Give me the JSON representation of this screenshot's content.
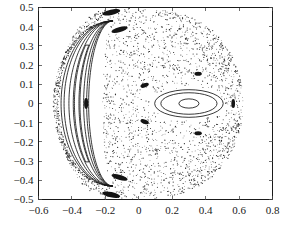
{
  "figure": {
    "kind": "poincare-section-scatter-plot",
    "background_color": "#ffffff",
    "frame_color": "#1a1a1a",
    "point_color": "#2b2b2b",
    "curve_color": "#161616"
  },
  "chart_data": {
    "type": "scatter",
    "title": "",
    "subtitle": "",
    "xlabel": "",
    "ylabel": "",
    "xlim": [
      -0.6,
      0.8
    ],
    "ylim": [
      -0.5,
      0.5
    ],
    "grid": false,
    "legend": "none",
    "xticks": [
      -0.6,
      -0.4,
      -0.2,
      0,
      0.2,
      0.4,
      0.6,
      0.8
    ],
    "xticklabels": [
      "−0.6",
      "−0.4",
      "−0.2",
      "0",
      "0.2",
      "0.4",
      "0.6",
      "0.8"
    ],
    "yticks": [
      0.5,
      0.4,
      0.3,
      0.2,
      0.1,
      0,
      -0.1,
      -0.2,
      -0.3,
      -0.4,
      -0.5
    ],
    "yticklabels": [
      "0.5",
      "0.4",
      "0.3",
      "0.2",
      "0.1",
      "0",
      "−0.1",
      "−0.2",
      "−0.3",
      "−0.4",
      "−0.5"
    ],
    "series": [
      {
        "name": "chaotic sea",
        "kind": "scatter",
        "n_points": 2400,
        "marker": "point",
        "marker_size": 0.55,
        "color": "#2b2b2b",
        "region": "annulus bounded outwardly by x in [-0.47, 0.60], y in [-0.49, 0.49]"
      },
      {
        "name": "central island chain",
        "kind": "closed-curves",
        "center": [
          0.3,
          0.0
        ],
        "curves": [
          {
            "semi_x": 0.205,
            "semi_y": 0.072
          },
          {
            "semi_x": 0.168,
            "semi_y": 0.056
          },
          {
            "semi_x": 0.06,
            "semi_y": 0.024
          }
        ]
      },
      {
        "name": "left crescent KAM structure",
        "kind": "nested-crescents",
        "tip_top": [
          -0.155,
          0.43
        ],
        "tip_bottom": [
          -0.155,
          -0.43
        ],
        "outer_extent_x": -0.47,
        "n_curves": 4
      }
    ],
    "islands": [
      {
        "label": "left-axis island",
        "center": [
          -0.315,
          0.0
        ],
        "semi_x": 0.012,
        "semi_y": 0.028,
        "angle_deg": 0
      },
      {
        "label": "right-axis island",
        "center": [
          0.565,
          0.0
        ],
        "semi_x": 0.011,
        "semi_y": 0.024,
        "angle_deg": 0
      },
      {
        "label": "upper-inner island",
        "center": [
          0.035,
          0.095
        ],
        "semi_x": 0.026,
        "semi_y": 0.011,
        "angle_deg": -20
      },
      {
        "label": "lower-inner island",
        "center": [
          0.035,
          -0.095
        ],
        "semi_x": 0.026,
        "semi_y": 0.011,
        "angle_deg": 20
      },
      {
        "label": "upper-right island",
        "center": [
          0.355,
          0.155
        ],
        "semi_x": 0.022,
        "semi_y": 0.011,
        "angle_deg": 0
      },
      {
        "label": "lower-right island",
        "center": [
          0.355,
          -0.155
        ],
        "semi_x": 0.022,
        "semi_y": 0.011,
        "angle_deg": 0
      },
      {
        "label": "upper-arc island",
        "center": [
          -0.115,
          0.385
        ],
        "semi_x": 0.05,
        "semi_y": 0.013,
        "angle_deg": -16
      },
      {
        "label": "lower-arc island",
        "center": [
          -0.115,
          -0.385
        ],
        "semi_x": 0.05,
        "semi_y": 0.013,
        "angle_deg": 16
      },
      {
        "label": "upper-edge island",
        "center": [
          -0.165,
          0.475
        ],
        "semi_x": 0.055,
        "semi_y": 0.014,
        "angle_deg": -12
      },
      {
        "label": "lower-edge island",
        "center": [
          -0.165,
          -0.475
        ],
        "semi_x": 0.055,
        "semi_y": 0.014,
        "angle_deg": 12
      }
    ]
  }
}
